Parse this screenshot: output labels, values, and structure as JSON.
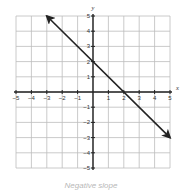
{
  "chart_data": {
    "type": "line",
    "title": "",
    "xlabel": "x",
    "ylabel": "y",
    "xlim": [
      -5,
      5
    ],
    "ylim": [
      -5,
      5
    ],
    "grid": true,
    "x_ticks": [
      -5,
      -4,
      -3,
      -2,
      -1,
      1,
      2,
      3,
      4,
      5
    ],
    "y_ticks": [
      5,
      4,
      3,
      2,
      1,
      -1,
      -2,
      -3,
      -4,
      -5
    ],
    "series": [
      {
        "name": "line",
        "equation": "y = -x + 2",
        "slope": -1,
        "intercept": 2,
        "x": [
          -3,
          5
        ],
        "y": [
          5,
          -3
        ],
        "arrows": "both",
        "color": "#222222"
      }
    ],
    "caption": "Negative slope"
  },
  "colors": {
    "grid": "#bdbdbd",
    "axis": "#222222",
    "line": "#222222"
  }
}
